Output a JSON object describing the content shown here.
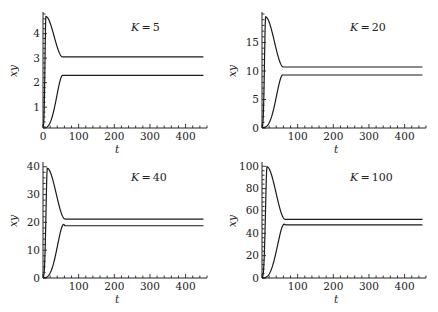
{
  "chart_data": [
    {
      "type": "line",
      "title": "K=5",
      "title_var": "K",
      "title_value": "5",
      "xlabel": "t",
      "ylabel": "xy",
      "xlim": [
        0,
        460
      ],
      "ylim": [
        0.15,
        4.8
      ],
      "x_ticks": [
        0,
        100,
        200,
        300,
        400
      ],
      "x_minor_step": 20,
      "y_ticks": [
        1,
        2,
        3,
        4
      ],
      "y_minor_step": 0.2,
      "series": [
        {
          "name": "upper",
          "start": 0.2,
          "peak": 4.7,
          "peak_t": 8,
          "plateau": 3.05,
          "settle_t": 55
        },
        {
          "name": "lower",
          "start": 0.15,
          "peak": 2.3,
          "peak_t": 55,
          "plateau": 2.3,
          "settle_t": 55
        }
      ]
    },
    {
      "type": "line",
      "title": "K=20",
      "title_var": "K",
      "title_value": "20",
      "xlabel": "t",
      "ylabel": "xy",
      "xlim": [
        0,
        460
      ],
      "ylim": [
        0,
        20
      ],
      "x_ticks": [
        100,
        200,
        300,
        400
      ],
      "x_minor_step": 20,
      "y_ticks": [
        0,
        5,
        10,
        15
      ],
      "y_minor_step": 1,
      "series": [
        {
          "name": "upper",
          "start": 0.2,
          "peak": 19.5,
          "peak_t": 10,
          "plateau": 10.7,
          "settle_t": 60
        },
        {
          "name": "lower",
          "start": 0.1,
          "peak": 9.3,
          "peak_t": 58,
          "plateau": 9.3,
          "settle_t": 58
        }
      ]
    },
    {
      "type": "line",
      "title": "K=40",
      "title_var": "K",
      "title_value": "40",
      "xlabel": "t",
      "ylabel": "xy",
      "xlim": [
        0,
        460
      ],
      "ylim": [
        0,
        41
      ],
      "x_ticks": [
        100,
        200,
        300,
        400
      ],
      "x_minor_step": 20,
      "y_ticks": [
        0,
        10,
        20,
        30,
        40
      ],
      "y_minor_step": 2,
      "series": [
        {
          "name": "upper",
          "start": 0.3,
          "peak": 39.5,
          "peak_t": 12,
          "plateau": 21.2,
          "settle_t": 62
        },
        {
          "name": "lower",
          "start": 0.1,
          "peak": 19.3,
          "peak_t": 58,
          "plateau": 18.8,
          "settle_t": 62
        }
      ]
    },
    {
      "type": "line",
      "title": "K=100",
      "title_var": "K",
      "title_value": "100",
      "xlabel": "t",
      "ylabel": "xy",
      "xlim": [
        0,
        460
      ],
      "ylim": [
        0,
        102
      ],
      "x_ticks": [
        100,
        200,
        300,
        400
      ],
      "x_minor_step": 20,
      "y_ticks": [
        0,
        20,
        40,
        60,
        80,
        100
      ],
      "y_minor_step": 4,
      "series": [
        {
          "name": "upper",
          "start": 0.5,
          "peak": 99.5,
          "peak_t": 14,
          "plateau": 52.5,
          "settle_t": 65
        },
        {
          "name": "lower",
          "start": 0.1,
          "peak": 48.2,
          "peak_t": 62,
          "plateau": 47.5,
          "settle_t": 66
        }
      ]
    }
  ]
}
